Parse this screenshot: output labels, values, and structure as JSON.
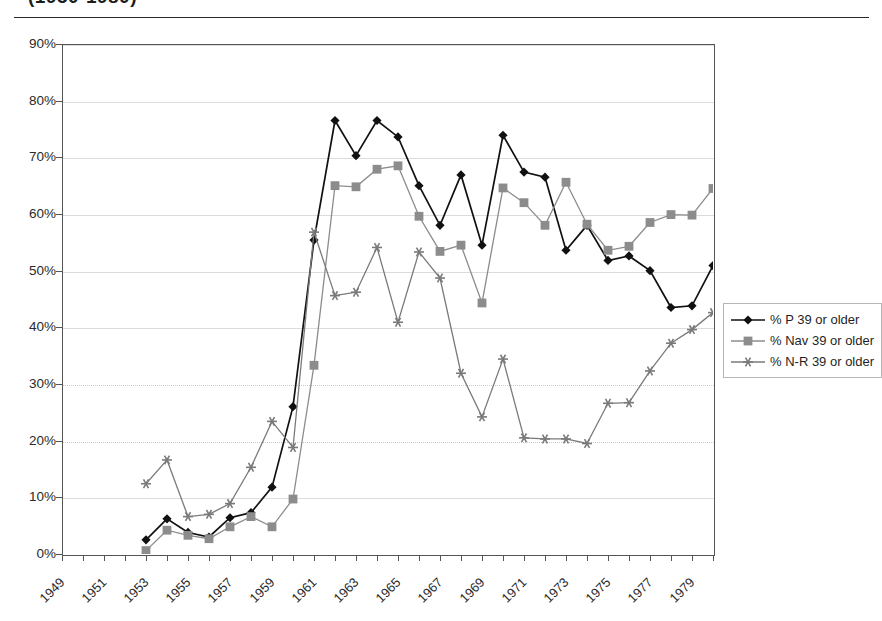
{
  "caption": "(1950-1980)",
  "legend": {
    "position": "right",
    "items": [
      {
        "label": "% P 39 or older",
        "color": "#111111",
        "marker": "diamond",
        "key": "p"
      },
      {
        "label": "% Nav 39 or older",
        "color": "#8c8c8c",
        "marker": "square",
        "key": "nav"
      },
      {
        "label": "% N-R 39 or older",
        "color": "#7a7a7a",
        "marker": "star",
        "key": "nr"
      }
    ]
  },
  "axes": {
    "y_ticks": [
      "0%",
      "10%",
      "20%",
      "30%",
      "40%",
      "50%",
      "60%",
      "70%",
      "80%",
      "90%"
    ],
    "x_ticks": [
      "1949",
      "1951",
      "1953",
      "1955",
      "1957",
      "1959",
      "1961",
      "1963",
      "1965",
      "1967",
      "1969",
      "1971",
      "1973",
      "1975",
      "1977",
      "1979"
    ]
  },
  "chart_data": {
    "type": "line",
    "title": "(1950-1980)",
    "xlabel": "",
    "ylabel": "",
    "xlim": [
      1949,
      1980
    ],
    "ylim": [
      0,
      90
    ],
    "ytick_step": 10,
    "xtick_step": 2,
    "xtick_minor_step": 1,
    "grid": true,
    "legend_position": "right",
    "x": [
      1953,
      1954,
      1955,
      1956,
      1957,
      1958,
      1959,
      1960,
      1961,
      1962,
      1963,
      1964,
      1965,
      1966,
      1967,
      1968,
      1969,
      1970,
      1971,
      1972,
      1973,
      1974,
      1975,
      1976,
      1977,
      1978,
      1979,
      1980
    ],
    "series": [
      {
        "name": "% P 39 or older",
        "color": "#111111",
        "marker": "diamond",
        "values": [
          2.5,
          6.2,
          3.8,
          3.0,
          6.4,
          7.3,
          11.8,
          26.0,
          55.4,
          76.5,
          70.3,
          76.5,
          73.6,
          65.0,
          58.0,
          66.9,
          54.5,
          73.9,
          67.4,
          66.5,
          53.6,
          58.0,
          51.8,
          52.6,
          50.0,
          43.5,
          43.8,
          50.9
        ]
      },
      {
        "name": "% Nav 39 or older",
        "color": "#8c8c8c",
        "marker": "square",
        "values": [
          0.6,
          4.2,
          3.3,
          2.7,
          4.8,
          6.6,
          4.8,
          9.7,
          33.3,
          65.0,
          64.8,
          67.9,
          68.5,
          59.6,
          53.4,
          54.5,
          44.3,
          64.6,
          62.0,
          58.0,
          65.6,
          58.2,
          53.6,
          54.3,
          58.5,
          59.9,
          59.8,
          64.5
        ]
      },
      {
        "name": "% N-R 39 or older",
        "color": "#7a7a7a",
        "marker": "star",
        "values": [
          12.4,
          16.6,
          6.6,
          7.0,
          8.9,
          15.3,
          23.4,
          18.8,
          56.8,
          45.6,
          46.2,
          54.1,
          40.9,
          53.3,
          48.7,
          31.9,
          24.2,
          34.4,
          20.5,
          20.3,
          20.3,
          19.5,
          26.6,
          26.7,
          32.3,
          37.2,
          39.6,
          42.6
        ]
      }
    ]
  }
}
